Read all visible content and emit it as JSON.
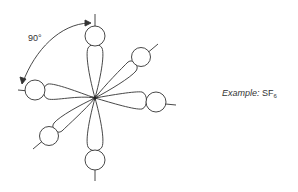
{
  "diagram": {
    "angle_label": "90°",
    "colors": {
      "stroke": "#333333",
      "background": "#ffffff"
    }
  },
  "caption": {
    "prefix": "Example:",
    "formula_main": "SF",
    "formula_sub": "6"
  }
}
